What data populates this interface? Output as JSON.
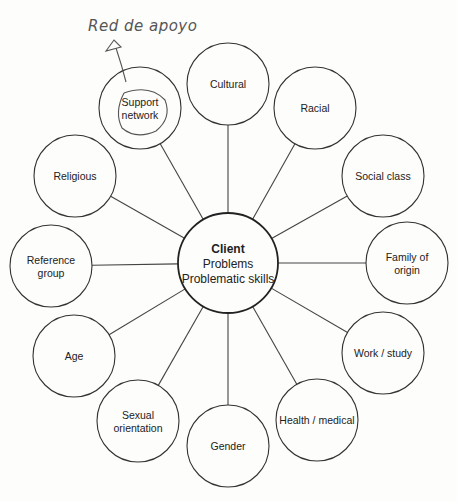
{
  "diagram": {
    "type": "hub-and-spoke",
    "hub": {
      "title": "Client",
      "lines": [
        "Problems",
        "Problematic skills"
      ],
      "cx": 228,
      "cy": 263,
      "r": 50
    },
    "nodes": [
      {
        "label": [
          "Cultural"
        ],
        "cx": 228,
        "cy": 84
      },
      {
        "label": [
          "Racial"
        ],
        "cx": 315,
        "cy": 108
      },
      {
        "label": [
          "Social class"
        ],
        "cx": 383,
        "cy": 176
      },
      {
        "label": [
          "Family of",
          "origin"
        ],
        "cx": 407,
        "cy": 263
      },
      {
        "label": [
          "Work / study"
        ],
        "cx": 383,
        "cy": 353
      },
      {
        "label": [
          "Health / medical"
        ],
        "cx": 317,
        "cy": 420
      },
      {
        "label": [
          "Gender"
        ],
        "cx": 228,
        "cy": 446
      },
      {
        "label": [
          "Sexual",
          "orientation"
        ],
        "cx": 138,
        "cy": 421
      },
      {
        "label": [
          "Age"
        ],
        "cx": 74,
        "cy": 356
      },
      {
        "label": [
          "Reference",
          "group"
        ],
        "cx": 51,
        "cy": 266
      },
      {
        "label": [
          "Religious"
        ],
        "cx": 75,
        "cy": 176
      },
      {
        "label": [
          "Support",
          "network"
        ],
        "cx": 140,
        "cy": 108
      }
    ],
    "node_radius": 41,
    "annotation": {
      "text": "Red de apoyo",
      "target": "Support network"
    }
  }
}
